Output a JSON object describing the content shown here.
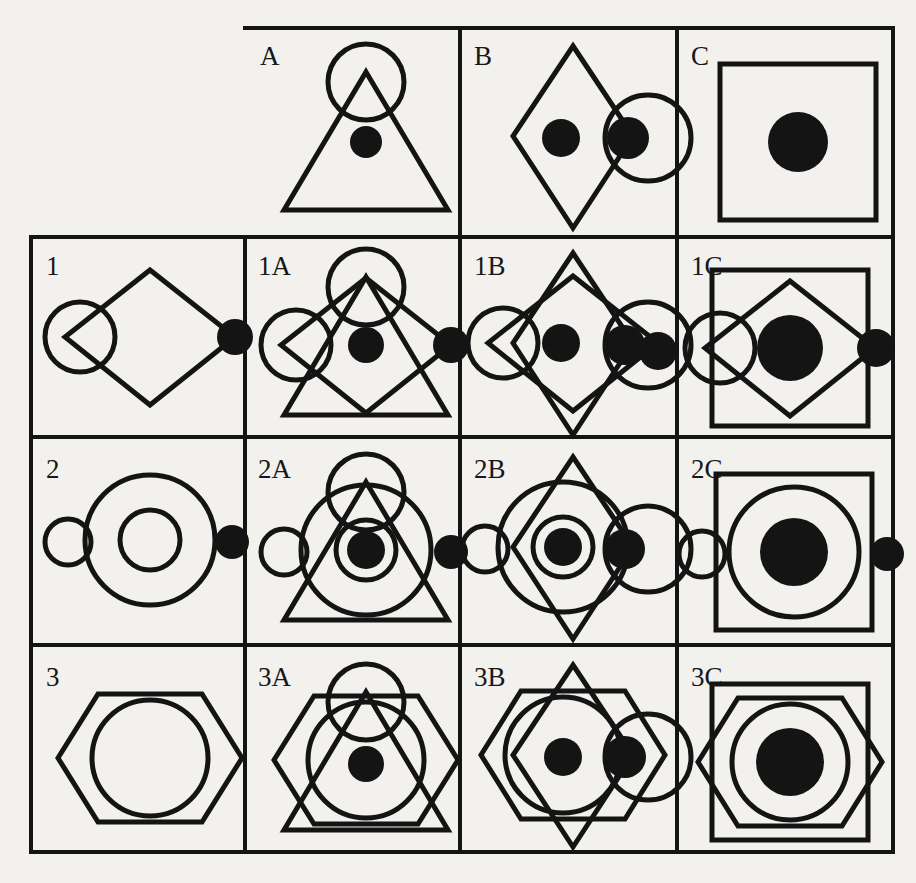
{
  "page": {
    "background_color": "#f2f1ee",
    "ink_color": "#141414",
    "canvas": {
      "width": 916,
      "height": 883
    }
  },
  "grid": {
    "columns": [
      "",
      "A",
      "B",
      "C"
    ],
    "rows": [
      "",
      "1",
      "2",
      "3"
    ],
    "col_x": [
      31,
      245,
      460,
      677,
      893
    ],
    "row_y": [
      28,
      237,
      437,
      645,
      852
    ],
    "stroke_width": 4,
    "corner_cell_empty": true
  },
  "labels": {
    "header": [
      "A",
      "B",
      "C"
    ],
    "side": [
      "1",
      "2",
      "3"
    ],
    "cells": [
      [
        "1A",
        "1B",
        "1C"
      ],
      [
        "2A",
        "2B",
        "2C"
      ],
      [
        "3A",
        "3B",
        "3C"
      ]
    ]
  },
  "legend_shapes": {
    "A": {
      "name": "triangle-with-apex-circle-and-center-dot",
      "parts": [
        "triangle",
        "small-circle-at-apex",
        "filled-dot-center"
      ]
    },
    "B": {
      "name": "tall-diamond-with-right-circle-and-dots",
      "parts": [
        "tall-diamond",
        "circle-right",
        "filled-dot-center",
        "filled-dot-right-edge"
      ]
    },
    "C": {
      "name": "square-with-large-center-dot",
      "parts": [
        "square",
        "large-filled-dot-center"
      ]
    },
    "1": {
      "name": "wide-diamond-with-left-circle-and-right-dot",
      "parts": [
        "wide-diamond",
        "circle-left",
        "filled-dot-right-vertex"
      ]
    },
    "2": {
      "name": "concentric-circles-with-side-circle-and-dot",
      "parts": [
        "large-circle",
        "inner-circle",
        "small-circle-left",
        "small-filled-dot-right"
      ]
    },
    "3": {
      "name": "hexagon-with-inner-circle",
      "parts": [
        "hexagon",
        "inner-circle"
      ]
    }
  },
  "cell_contents": {
    "1A": [
      "triangle",
      "small-circle-at-apex",
      "wide-diamond",
      "circle-left",
      "filled-dot-center",
      "filled-dot-right-vertex"
    ],
    "1B": [
      "tall-diamond",
      "wide-diamond",
      "circle-left",
      "circle-right",
      "filled-dot-center",
      "filled-dot-right-edge"
    ],
    "1C": [
      "square",
      "wide-diamond",
      "circle-left",
      "large-filled-dot-center",
      "filled-dot-right-vertex"
    ],
    "2A": [
      "triangle",
      "small-circle-at-apex",
      "large-circle",
      "inner-circle",
      "small-circle-left",
      "filled-dot-center",
      "small-filled-dot-right"
    ],
    "2B": [
      "tall-diamond",
      "large-circle",
      "inner-circle",
      "circle-right",
      "small-circle-left",
      "filled-dot-center",
      "filled-dot-right-edge"
    ],
    "2C": [
      "square",
      "large-circle",
      "large-filled-dot-center",
      "small-circle-left",
      "small-filled-dot-right"
    ],
    "3A": [
      "triangle",
      "small-circle-at-apex",
      "hexagon",
      "inner-circle",
      "filled-dot-center"
    ],
    "3B": [
      "tall-diamond",
      "hexagon",
      "inner-circle",
      "circle-right",
      "filled-dot-center",
      "filled-dot-right-edge"
    ],
    "3C": [
      "square",
      "hexagon",
      "inner-circle",
      "large-filled-dot-center"
    ]
  }
}
